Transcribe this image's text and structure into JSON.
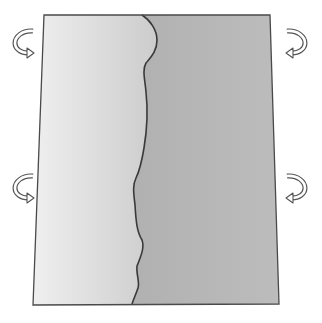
{
  "diagram": {
    "colors": {
      "background": "#ffffff",
      "left_region_start": "#efefef",
      "left_region_end": "#cccccc",
      "right_region_start": "#a9a9a9",
      "right_region_end": "#bcbcbc",
      "outline": "#4a4a4a",
      "boundary": "#3a3a3a",
      "arrow_fill": "#ffffff",
      "arrow_stroke": "#555555"
    },
    "rectangle": {
      "top_left": [
        44,
        15
      ],
      "top_right": [
        270,
        15
      ],
      "bottom_right": [
        279,
        304
      ],
      "bottom_left": [
        33,
        305
      ]
    },
    "boundary_points": [
      [
        142,
        15
      ],
      [
        152,
        24
      ],
      [
        157,
        38
      ],
      [
        155,
        52
      ],
      [
        147,
        62
      ],
      [
        143,
        72
      ],
      [
        146,
        88
      ],
      [
        148,
        108
      ],
      [
        146,
        128
      ],
      [
        144,
        148
      ],
      [
        141,
        165
      ],
      [
        137,
        176
      ],
      [
        133,
        186
      ],
      [
        135,
        200
      ],
      [
        136,
        228
      ],
      [
        142,
        238
      ],
      [
        142,
        252
      ],
      [
        137,
        266
      ],
      [
        139,
        282
      ],
      [
        134,
        294
      ],
      [
        132,
        304
      ]
    ],
    "arrows": [
      {
        "name": "left-top-arrow",
        "side": "left",
        "direction": "counterclockwise-down",
        "cx": 24,
        "cy": 42
      },
      {
        "name": "left-bottom-arrow",
        "side": "left",
        "direction": "counterclockwise-down",
        "cx": 24,
        "cy": 187
      },
      {
        "name": "right-top-arrow",
        "side": "right",
        "direction": "clockwise-down",
        "cx": 296,
        "cy": 42
      },
      {
        "name": "right-bottom-arrow",
        "side": "right",
        "direction": "clockwise-down",
        "cx": 296,
        "cy": 187
      }
    ]
  }
}
